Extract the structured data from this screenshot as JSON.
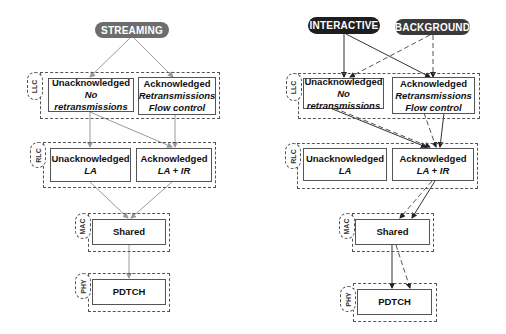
{
  "left": {
    "traffic_classes": [
      {
        "label": "STREAMING"
      }
    ],
    "layers": {
      "llc": {
        "tag": "LLC",
        "unack": {
          "title": "Unacknowledged",
          "sub": "No retransmissions"
        },
        "ack": {
          "title": "Acknowledged",
          "sub1": "Retransmissions",
          "sub2": "Flow control"
        }
      },
      "rlc": {
        "tag": "RLC",
        "unack": {
          "title": "Unacknowledged",
          "sub": "LA"
        },
        "ack": {
          "title": "Acknowledged",
          "sub": "LA + IR"
        }
      },
      "mac": {
        "tag": "MAC",
        "box": "Shared"
      },
      "phy": {
        "tag": "PHY",
        "box": "PDTCH"
      }
    }
  },
  "right": {
    "traffic_classes": [
      {
        "label": "INTERACTIVE"
      },
      {
        "label": "BACKGROUND"
      }
    ],
    "layers": {
      "llc": {
        "tag": "LLC",
        "unack": {
          "title": "Unacknowledged",
          "sub": "No retransmissions"
        },
        "ack": {
          "title": "Acknowledged",
          "sub1": "Retransmissions",
          "sub2": "Flow control"
        }
      },
      "rlc": {
        "tag": "RLC",
        "unack": {
          "title": "Unacknowledged",
          "sub": "LA"
        },
        "ack": {
          "title": "Acknowledged",
          "sub": "LA + IR"
        }
      },
      "mac": {
        "tag": "MAC",
        "box": "Shared"
      },
      "phy": {
        "tag": "PHY",
        "box": "PDTCH"
      }
    }
  },
  "colors": {
    "streaming": "#6d6d6d",
    "interactive": "#1e1e1e",
    "background": "#3a3a3a",
    "line_light": "#9a9a9a",
    "line_dark": "#333333"
  }
}
